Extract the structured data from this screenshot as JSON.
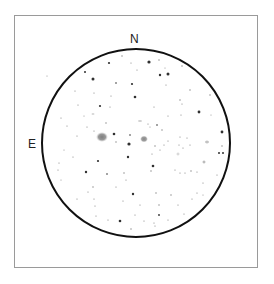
{
  "sketch": {
    "labels": {
      "north": "N",
      "east": "E"
    },
    "colors": {
      "circle": "#111111",
      "frame": "#9a9a9a",
      "star": "#1a1a1a",
      "nebula": "#777777"
    },
    "field_circle": {
      "cx": 136,
      "cy": 143,
      "r": 94
    },
    "galaxies": [
      {
        "x": 102,
        "y": 137,
        "rx": 6,
        "ry": 5,
        "opacity": 0.75
      },
      {
        "x": 144,
        "y": 139,
        "rx": 4,
        "ry": 3.5,
        "opacity": 0.7
      },
      {
        "x": 207,
        "y": 142,
        "rx": 2.5,
        "ry": 2,
        "opacity": 0.4
      },
      {
        "x": 204,
        "y": 162,
        "rx": 2,
        "ry": 2,
        "opacity": 0.45
      },
      {
        "x": 178,
        "y": 154,
        "rx": 2,
        "ry": 2,
        "opacity": 0.25
      },
      {
        "x": 140,
        "y": 121,
        "rx": 2.5,
        "ry": 1.5,
        "opacity": 0.3
      },
      {
        "x": 93,
        "y": 114,
        "rx": 2,
        "ry": 1.5,
        "opacity": 0.25
      }
    ],
    "stars": [
      [
        149,
        62,
        1.6
      ],
      [
        109,
        63,
        1.1
      ],
      [
        122,
        56,
        0.7
      ],
      [
        131,
        63,
        0.6
      ],
      [
        159,
        60,
        0.7
      ],
      [
        182,
        66,
        0.7
      ],
      [
        93,
        79,
        1.5
      ],
      [
        85,
        72,
        1.0
      ],
      [
        160,
        75,
        1.2
      ],
      [
        168,
        74,
        1.5
      ],
      [
        137,
        70,
        0.6
      ],
      [
        165,
        68,
        0.5
      ],
      [
        116,
        83,
        0.8
      ],
      [
        132,
        84,
        1.1
      ],
      [
        75,
        91,
        0.6
      ],
      [
        94,
        93,
        0.6
      ],
      [
        166,
        85,
        0.6
      ],
      [
        190,
        90,
        0.7
      ],
      [
        135,
        97,
        1.3
      ],
      [
        111,
        96,
        0.6
      ],
      [
        180,
        100,
        0.7
      ],
      [
        210,
        95,
        0.7
      ],
      [
        78,
        105,
        0.6
      ],
      [
        100,
        106,
        1.1
      ],
      [
        110,
        107,
        0.6
      ],
      [
        154,
        107,
        0.6
      ],
      [
        182,
        104,
        0.6
      ],
      [
        199,
        112,
        1.4
      ],
      [
        61,
        118,
        0.6
      ],
      [
        84,
        116,
        0.5
      ],
      [
        106,
        123,
        0.7
      ],
      [
        148,
        124,
        0.6
      ],
      [
        157,
        125,
        0.8
      ],
      [
        168,
        116,
        0.6
      ],
      [
        181,
        115,
        0.6
      ],
      [
        211,
        115,
        0.5
      ],
      [
        67,
        126,
        0.6
      ],
      [
        87,
        127,
        0.6
      ],
      [
        94,
        131,
        0.6
      ],
      [
        114,
        134,
        1.3
      ],
      [
        130,
        135,
        0.8
      ],
      [
        116,
        142,
        0.7
      ],
      [
        77,
        136,
        0.6
      ],
      [
        162,
        130,
        0.7
      ],
      [
        150,
        127,
        0.5
      ],
      [
        222,
        132,
        1.4
      ],
      [
        180,
        137,
        0.6
      ],
      [
        187,
        138,
        0.6
      ],
      [
        129,
        144,
        1.6
      ],
      [
        155,
        146,
        0.7
      ],
      [
        164,
        145,
        0.6
      ],
      [
        168,
        141,
        0.6
      ],
      [
        179,
        145,
        0.6
      ],
      [
        183,
        148,
        0.6
      ],
      [
        190,
        145,
        0.6
      ],
      [
        222,
        146,
        0.7
      ],
      [
        219,
        153,
        1.0
      ],
      [
        223,
        153,
        1.0
      ],
      [
        64,
        150,
        0.5
      ],
      [
        73,
        157,
        0.6
      ],
      [
        128,
        157,
        1.2
      ],
      [
        152,
        154,
        0.6
      ],
      [
        160,
        150,
        0.6
      ],
      [
        98,
        161,
        1.1
      ],
      [
        153,
        166,
        1.3
      ],
      [
        151,
        171,
        0.7
      ],
      [
        59,
        163,
        0.6
      ],
      [
        58,
        170,
        0.6
      ],
      [
        86,
        172,
        1.2
      ],
      [
        107,
        174,
        0.8
      ],
      [
        124,
        173,
        0.7
      ],
      [
        126,
        180,
        0.6
      ],
      [
        175,
        170,
        0.6
      ],
      [
        180,
        173,
        0.6
      ],
      [
        185,
        173,
        0.6
      ],
      [
        191,
        171,
        0.7
      ],
      [
        197,
        172,
        0.6
      ],
      [
        203,
        183,
        0.6
      ],
      [
        217,
        175,
        0.6
      ],
      [
        61,
        180,
        0.5
      ],
      [
        116,
        187,
        0.6
      ],
      [
        93,
        187,
        0.7
      ],
      [
        88,
        192,
        0.6
      ],
      [
        133,
        194,
        1.2
      ],
      [
        156,
        193,
        0.7
      ],
      [
        171,
        195,
        0.7
      ],
      [
        197,
        193,
        0.6
      ],
      [
        192,
        199,
        0.6
      ],
      [
        203,
        195,
        0.5
      ],
      [
        77,
        199,
        0.6
      ],
      [
        94,
        199,
        0.6
      ],
      [
        123,
        201,
        0.6
      ],
      [
        140,
        205,
        0.6
      ],
      [
        159,
        205,
        0.7
      ],
      [
        178,
        205,
        0.6
      ],
      [
        95,
        206,
        0.6
      ],
      [
        159,
        215,
        0.9
      ],
      [
        184,
        214,
        0.6
      ],
      [
        135,
        215,
        0.6
      ],
      [
        96,
        216,
        0.6
      ],
      [
        108,
        220,
        0.6
      ],
      [
        120,
        221,
        1.3
      ],
      [
        144,
        221,
        0.6
      ],
      [
        168,
        220,
        0.6
      ],
      [
        131,
        229,
        0.7
      ],
      [
        155,
        226,
        0.6
      ],
      [
        47,
        76,
        0.5
      ],
      [
        154,
        223,
        0.6
      ]
    ]
  }
}
